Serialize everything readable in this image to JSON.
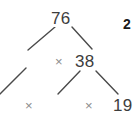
{
  "diagram": {
    "type": "factor-tree",
    "colors": {
      "background": "#ffffff",
      "node_text": "#3d3d3d",
      "operator_text": "#8c8c8c",
      "branch_stroke": "#4a4a4a",
      "marker_text": "#1a1a1a"
    },
    "nodes": [
      {
        "id": "root",
        "label": "76",
        "x": 60,
        "y": 18
      },
      {
        "id": "child-right",
        "label": "38",
        "x": 84,
        "y": 61
      },
      {
        "id": "leaf-right",
        "label": "19",
        "x": 121,
        "y": 105
      }
    ],
    "operators": [
      {
        "id": "op-mid",
        "label": "×",
        "x": 59,
        "y": 61
      },
      {
        "id": "op-left",
        "label": "×",
        "x": 29,
        "y": 105
      },
      {
        "id": "op-right",
        "label": "×",
        "x": 89,
        "y": 105
      }
    ],
    "markers": [
      {
        "id": "marker-right-edge",
        "label": "2",
        "x": 128,
        "y": 24,
        "note": "bold, clipped at right edge"
      }
    ],
    "branches": [
      {
        "id": "branch-76-left",
        "x1": 55,
        "y1": 27,
        "x2": 28,
        "y2": 50
      },
      {
        "id": "branch-76-right",
        "x1": 72,
        "y1": 27,
        "x2": 92,
        "y2": 49
      },
      {
        "id": "branch-38-left",
        "x1": 80,
        "y1": 71,
        "x2": 58,
        "y2": 94
      },
      {
        "id": "branch-38-right",
        "x1": 96,
        "y1": 71,
        "x2": 118,
        "y2": 94
      },
      {
        "id": "branch-partial-left-edge",
        "x1": 0,
        "y1": 94,
        "x2": 26,
        "y2": 68
      }
    ]
  }
}
